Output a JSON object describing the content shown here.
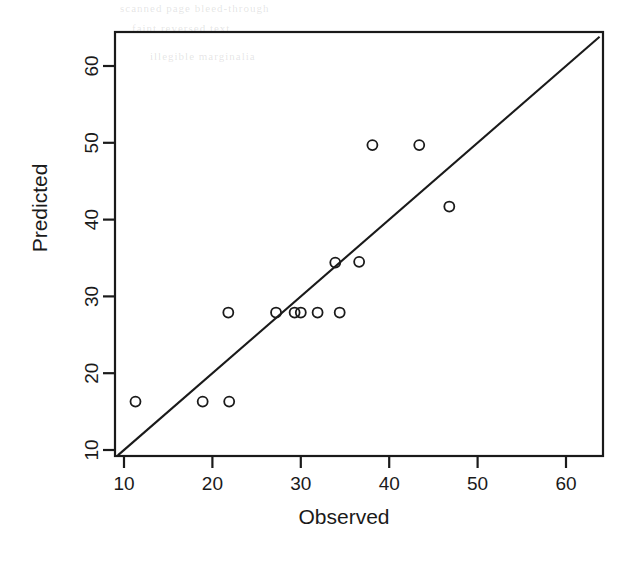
{
  "figure": {
    "background_color": "#ffffff",
    "foreground_color": "#1a1a1a",
    "bleed_through_text": {
      "line1": "scanned page bleed-through",
      "line2": "faint reversed text",
      "line3": "illegible marginalia"
    }
  },
  "chart_data": {
    "type": "scatter",
    "title": "",
    "xlabel": "Observed",
    "ylabel": "Predicted",
    "xlim": [
      9,
      64
    ],
    "ylim": [
      9,
      64
    ],
    "xticks": [
      10,
      20,
      30,
      40,
      50,
      60
    ],
    "yticks": [
      10,
      20,
      30,
      40,
      50,
      60
    ],
    "xticklabels": [
      "10",
      "20",
      "30",
      "40",
      "50",
      "60"
    ],
    "yticklabels": [
      "10",
      "20",
      "30",
      "40",
      "50",
      "60"
    ],
    "grid": false,
    "legend": null,
    "marker": "open-circle",
    "marker_size": 5,
    "points": [
      {
        "x": 11.3,
        "y": 16.3
      },
      {
        "x": 18.9,
        "y": 16.3
      },
      {
        "x": 21.9,
        "y": 16.3
      },
      {
        "x": 21.8,
        "y": 27.9
      },
      {
        "x": 27.2,
        "y": 27.9
      },
      {
        "x": 29.3,
        "y": 27.9
      },
      {
        "x": 30.0,
        "y": 27.9
      },
      {
        "x": 31.9,
        "y": 27.9
      },
      {
        "x": 34.4,
        "y": 27.9
      },
      {
        "x": 33.9,
        "y": 34.4
      },
      {
        "x": 36.6,
        "y": 34.5
      },
      {
        "x": 38.1,
        "y": 49.7
      },
      {
        "x": 43.4,
        "y": 49.7
      },
      {
        "x": 46.8,
        "y": 41.7
      }
    ],
    "reference_line": {
      "name": "one-to-one-line",
      "type": "identity",
      "slope": 1,
      "intercept": 0,
      "from": [
        9.3,
        9.3
      ],
      "to": [
        63.8,
        63.8
      ]
    }
  }
}
